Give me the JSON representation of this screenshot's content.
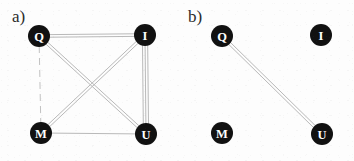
{
  "figure": {
    "width": 354,
    "height": 161,
    "background_color": "#fdfdfd",
    "node_fill_color": "#111111",
    "node_label_color": "#ffffff",
    "edge_color": "#b9b9b9",
    "panel_label_color": "#2b2b2b"
  },
  "panels": [
    {
      "id": "panel-a",
      "label": "a)",
      "label_x": 12,
      "label_y": 22,
      "nodes": [
        {
          "id": "Q",
          "label": "Q",
          "cx": 39,
          "cy": 36,
          "r": 11
        },
        {
          "id": "I",
          "label": "I",
          "cx": 145,
          "cy": 35,
          "r": 11
        },
        {
          "id": "M",
          "label": "M",
          "cx": 41,
          "cy": 133,
          "r": 11
        },
        {
          "id": "U",
          "label": "U",
          "cx": 146,
          "cy": 134,
          "r": 11
        }
      ],
      "edges": [
        {
          "from": "Q",
          "to": "I",
          "style": "double",
          "multiplicity": 2
        },
        {
          "from": "I",
          "to": "U",
          "style": "triple",
          "multiplicity": 3
        },
        {
          "from": "Q",
          "to": "M",
          "style": "dashed",
          "multiplicity": 1
        },
        {
          "from": "M",
          "to": "U",
          "style": "solid",
          "multiplicity": 1
        },
        {
          "from": "Q",
          "to": "U",
          "style": "double",
          "multiplicity": 2
        },
        {
          "from": "I",
          "to": "M",
          "style": "double",
          "multiplicity": 2
        }
      ]
    },
    {
      "id": "panel-b",
      "label": "b)",
      "label_x": 188,
      "label_y": 22,
      "nodes": [
        {
          "id": "Q",
          "label": "Q",
          "cx": 222,
          "cy": 36,
          "r": 11
        },
        {
          "id": "I",
          "label": "I",
          "cx": 321,
          "cy": 35,
          "r": 11
        },
        {
          "id": "M",
          "label": "M",
          "cx": 222,
          "cy": 133,
          "r": 11
        },
        {
          "id": "U",
          "label": "U",
          "cx": 322,
          "cy": 134,
          "r": 11
        }
      ],
      "edges": [
        {
          "from": "Q",
          "to": "U",
          "style": "double",
          "multiplicity": 2
        }
      ]
    }
  ]
}
